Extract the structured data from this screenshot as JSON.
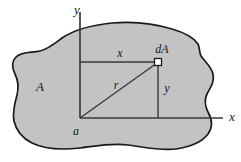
{
  "figure": {
    "kind": "engineering-mechanics-area-diagram",
    "background_color": "#ffffff",
    "region": {
      "label": "A",
      "fill_color": "#c3c3c3",
      "outline_color": "#1a1a1a"
    },
    "axes": {
      "origin_label": "a",
      "x_axis_label": "x",
      "y_axis_label": "y",
      "line_color": "#3a3a3a"
    },
    "element": {
      "label": "dA",
      "marker_fill": "#ffffff",
      "marker_stroke": "#1a1a1a"
    },
    "dimensions": {
      "horizontal_label": "x",
      "vertical_label": "y",
      "radial_label": "r"
    }
  }
}
